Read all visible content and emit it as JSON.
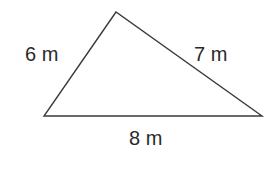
{
  "diagram": {
    "type": "triangle",
    "stroke_color": "#3a3a3a",
    "text_color": "#2a2a2a",
    "vertices": {
      "top": [
        116,
        12
      ],
      "left": [
        44,
        116
      ],
      "right": [
        262,
        116
      ]
    },
    "sides": [
      {
        "side": "left",
        "label": "6 m"
      },
      {
        "side": "right",
        "label": "7 m"
      },
      {
        "side": "bottom",
        "label": "8 m"
      }
    ]
  }
}
